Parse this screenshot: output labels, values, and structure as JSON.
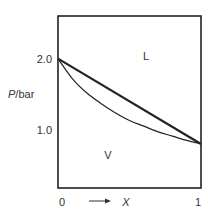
{
  "chart_data": {
    "type": "line",
    "title": "",
    "xlabel": "X",
    "ylabel": "P/bar",
    "xlim": [
      0,
      1
    ],
    "ylim": [
      0.18,
      2.6
    ],
    "x_ticks": [
      {
        "value": 0,
        "label": "0"
      },
      {
        "value": 1,
        "label": "1"
      }
    ],
    "y_ticks": [
      {
        "value": 2.0,
        "label": "2.0"
      },
      {
        "value": 1.0,
        "label": "1.0"
      }
    ],
    "series": [
      {
        "name": "liquid-line",
        "x": [
          0,
          1
        ],
        "y": [
          2.0,
          0.8
        ],
        "style": "thick"
      },
      {
        "name": "vapour-curve",
        "x": [
          0,
          0.1,
          0.2,
          0.3,
          0.4,
          0.5,
          0.6,
          0.7,
          0.8,
          0.9,
          1.0
        ],
        "y": [
          2.0,
          1.72,
          1.52,
          1.37,
          1.24,
          1.13,
          1.05,
          0.97,
          0.91,
          0.85,
          0.8
        ],
        "style": "thin"
      }
    ],
    "annotations": [
      {
        "text": "L",
        "x": 0.55,
        "y": 2.25
      },
      {
        "text": "V",
        "x": 0.25,
        "y": 0.72
      }
    ],
    "x_arrow": true
  }
}
